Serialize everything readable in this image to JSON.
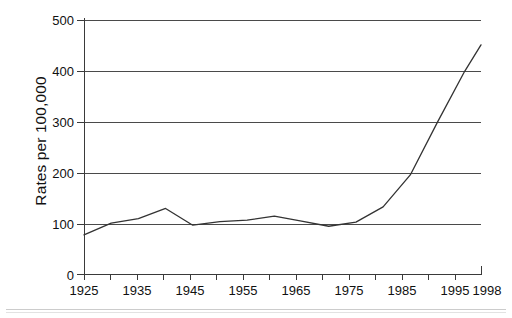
{
  "chart_data": {
    "type": "line",
    "title": "",
    "subtitle": "",
    "xlabel": "",
    "ylabel": "Rates per 100,000",
    "xlim": [
      1925,
      1998
    ],
    "ylim": [
      0,
      500
    ],
    "grid": true,
    "legend": null,
    "legend_position": "none",
    "y_ticks": [
      0,
      100,
      200,
      300,
      400,
      500
    ],
    "y_tick_labels": [
      "0",
      "100",
      "200",
      "300",
      "400",
      "500"
    ],
    "x_ticks": [
      1925,
      1930,
      1935,
      1940,
      1945,
      1950,
      1955,
      1960,
      1965,
      1970,
      1975,
      1980,
      1985,
      1990,
      1995,
      1998
    ],
    "x_tick_labels": [
      "1925",
      "",
      "1935",
      "",
      "1945",
      "",
      "1955",
      "",
      "1965",
      "",
      "1975",
      "",
      "1985",
      "",
      "1995",
      "1998"
    ],
    "x_labeled_ticks": [
      "1925",
      "1935",
      "1945",
      "1955",
      "1965",
      "1975",
      "1985",
      "1995",
      "1998"
    ],
    "series": [
      {
        "name": "Rates per 100,000",
        "color": "#333333",
        "x": [
          1925,
          1930,
          1935,
          1940,
          1945,
          1950,
          1955,
          1960,
          1965,
          1970,
          1975,
          1980,
          1985,
          1990,
          1995,
          1998
        ],
        "values": [
          78,
          101,
          110,
          130,
          97,
          104,
          107,
          115,
          105,
          95,
          103,
          133,
          196,
          300,
          400,
          452
        ]
      }
    ]
  },
  "figure": {
    "ylabel": "Rates per 100,000",
    "ytick_labels": [
      "500",
      "400",
      "300",
      "200",
      "100",
      "0"
    ],
    "xtick_labels": [
      "1925",
      "1935",
      "1945",
      "1955",
      "1965",
      "1975",
      "1985",
      "1995",
      "1998"
    ],
    "line_color": "#333333",
    "grid_color": "#4a4a4a",
    "axis_color": "#3a3a3a",
    "background": "#ffffff"
  }
}
